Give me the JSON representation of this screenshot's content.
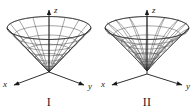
{
  "figure": {
    "background_color": "#ffffff",
    "line_color": "#3f3f3f",
    "axis_color": "#1a1a1a",
    "panels": [
      {
        "id": "figure-I",
        "caption": "I",
        "surface_name": "cone",
        "axes": {
          "x_label": "x",
          "y_label": "y",
          "z_label": "z"
        }
      },
      {
        "id": "figure-II",
        "caption": "II",
        "surface_name": "hyperboloid",
        "axes": {
          "x_label": "x",
          "y_label": "y",
          "z_label": "z"
        }
      }
    ]
  }
}
